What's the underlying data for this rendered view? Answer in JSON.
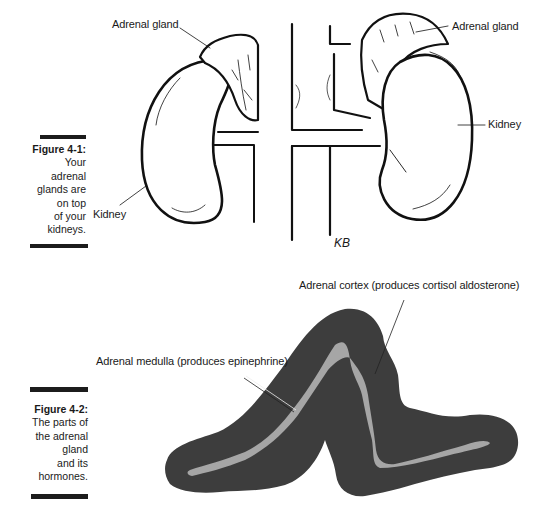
{
  "figures": [
    {
      "id": "figure-4-1",
      "title": "Figure 4-1:",
      "caption": "Your adrenal\nglands are\non top\nof your\nkidneys.",
      "labels": {
        "adrenal_left": "Adrenal gland",
        "adrenal_right": "Adrenal gland",
        "kidney_left": "Kidney",
        "kidney_right": "Kidney",
        "signature": "KB"
      }
    },
    {
      "id": "figure-4-2",
      "title": "Figure 4-2:",
      "caption": "The parts of\nthe adrenal\ngland\nand its\nhormones.",
      "labels": {
        "cortex": "Adrenal cortex (produces cortisol aldosterone)",
        "medulla": "Adrenal medulla (produces epinephrine)"
      },
      "colors": {
        "cortex": "#3d3d3d",
        "medulla": "#a6a6a6"
      }
    }
  ]
}
